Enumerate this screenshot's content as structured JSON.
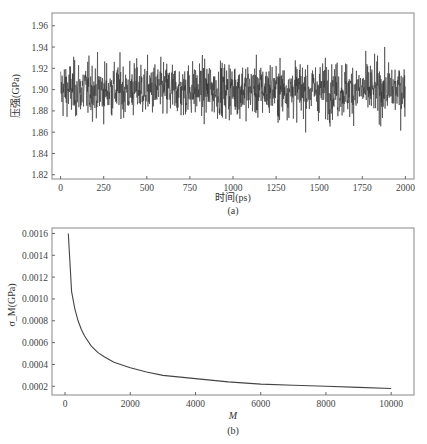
{
  "chart_data": [
    {
      "id": "a",
      "type": "line",
      "title": "",
      "xlabel": "时间(ps)",
      "ylabel": "压强(GPa)",
      "caption": "(a)",
      "xlim": [
        -50,
        2050
      ],
      "ylim": [
        1.816,
        1.972
      ],
      "xticks": [
        0,
        250,
        500,
        750,
        1000,
        1250,
        1500,
        1750,
        2000
      ],
      "xtick_labels": [
        "0",
        "250",
        "500",
        "750",
        "1000",
        "1250",
        "1500",
        "1750",
        "2000"
      ],
      "yticks": [
        1.82,
        1.84,
        1.86,
        1.88,
        1.9,
        1.92,
        1.94,
        1.96
      ],
      "ytick_labels": [
        "1.82",
        "1.84",
        "1.86",
        "1.88",
        "1.90",
        "1.92",
        "1.94",
        "1.96"
      ],
      "grid": false,
      "series": [
        {
          "name": "pressure",
          "description": "noisy time series fluctuating around 1.90 GPa, range approx 1.83–1.965",
          "mean": 1.9,
          "min": 1.83,
          "max": 1.965,
          "x_range": [
            0,
            2000
          ]
        }
      ]
    },
    {
      "id": "b",
      "type": "line",
      "title": "",
      "xlabel": "M",
      "ylabel": "σ_M(GPa)",
      "caption": "(b)",
      "xlim": [
        -400,
        10700
      ],
      "ylim": [
        0.00012,
        0.00165
      ],
      "xticks": [
        0,
        2000,
        4000,
        6000,
        8000,
        10000
      ],
      "xtick_labels": [
        "0",
        "2000",
        "4000",
        "6000",
        "8000",
        "10000"
      ],
      "yticks": [
        0.0002,
        0.0004,
        0.0006,
        0.0008,
        0.001,
        0.0012,
        0.0014,
        0.0016
      ],
      "ytick_labels": [
        "0.0002",
        "0.0004",
        "0.0006",
        "0.0008",
        "0.0010",
        "0.0012",
        "0.0014",
        "0.0016"
      ],
      "grid": false,
      "series": [
        {
          "name": "sigma_M",
          "x": [
            100,
            200,
            300,
            400,
            500,
            600,
            800,
            1000,
            1200,
            1500,
            2000,
            2500,
            3000,
            4000,
            5000,
            6000,
            7000,
            8000,
            9000,
            10000
          ],
          "y": [
            0.0016,
            0.00107,
            0.00091,
            0.0008,
            0.00072,
            0.00066,
            0.00057,
            0.00051,
            0.00047,
            0.00042,
            0.00037,
            0.00033,
            0.0003,
            0.00027,
            0.00024,
            0.00022,
            0.00021,
            0.0002,
            0.00019,
            0.00018
          ]
        }
      ]
    }
  ]
}
